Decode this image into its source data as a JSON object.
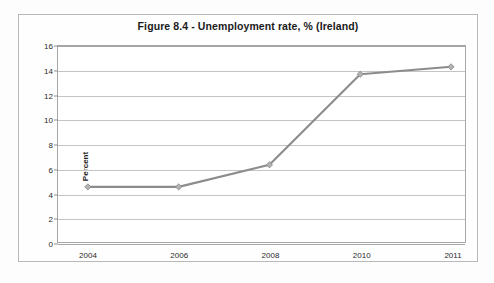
{
  "chart_data": {
    "type": "line",
    "title": "Figure 8.4 - Unemployment rate, % (Ireland)",
    "xlabel": "",
    "ylabel": "Percent",
    "categories": [
      "2004",
      "2006",
      "2008",
      "2010",
      "2011"
    ],
    "values": [
      4.5,
      4.5,
      6.3,
      13.7,
      14.3
    ],
    "series": [
      {
        "name": "Unemployment rate",
        "values": [
          4.5,
          4.5,
          6.3,
          13.7,
          14.3
        ]
      }
    ],
    "ylim": [
      0,
      16
    ],
    "ytick_step": 2,
    "yticks": [
      "16",
      "14",
      "12",
      "10",
      "8",
      "6",
      "4",
      "2",
      "0"
    ],
    "grid": "horizontal",
    "legend": "none",
    "line_color": "#8c8c8c",
    "marker_color": "#b3b3b3",
    "marker_shape": "diamond",
    "gridline_color": "#c4c4c4",
    "axis_color": "#a6a6a6",
    "background_color": "#ffffff"
  }
}
